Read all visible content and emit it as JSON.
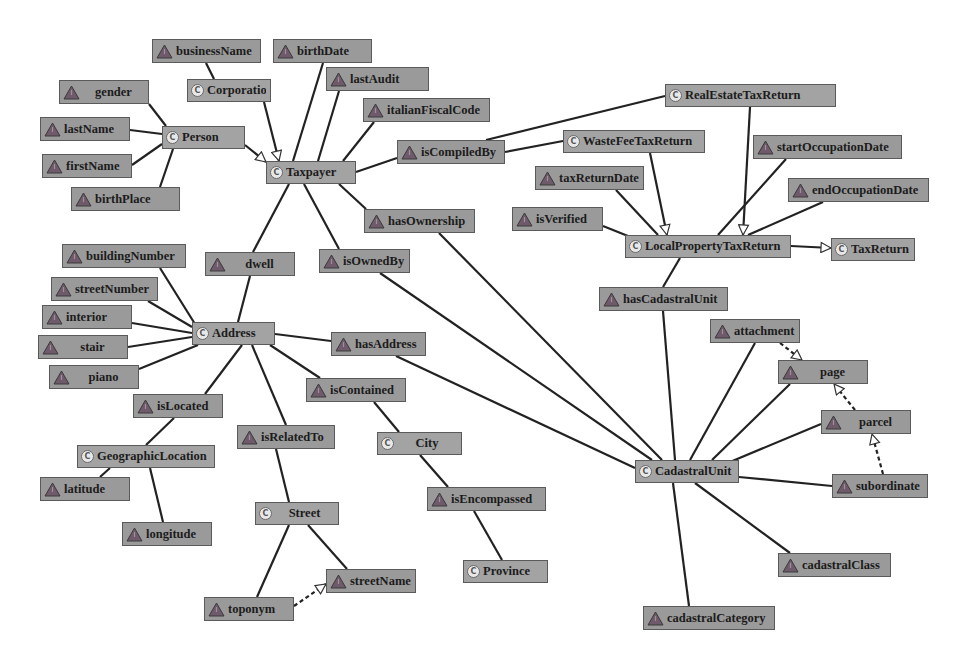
{
  "diagram": {
    "colors": {
      "node_fill": "#9a9a9a",
      "node_border": "#5a5a5a",
      "edge": "#222222",
      "property_icon": "#6e5a6a",
      "class_icon": "#e8e8e8",
      "background": "#ffffff"
    },
    "legend_hint": {
      "class_icon_glyph": "C",
      "property_icon_glyph": "triangle"
    },
    "nodes": [
      {
        "id": "businessName",
        "label": "businessName",
        "kind": "property",
        "x": 152,
        "y": 39,
        "w": 109,
        "h": 24
      },
      {
        "id": "birthDate",
        "label": "birthDate",
        "kind": "property",
        "x": 273,
        "y": 39,
        "w": 99,
        "h": 24
      },
      {
        "id": "Corporation",
        "label": "Corporation",
        "kind": "class",
        "x": 187,
        "y": 79,
        "w": 84,
        "h": 23
      },
      {
        "id": "lastAudit",
        "label": "lastAudit",
        "kind": "property",
        "x": 326,
        "y": 67,
        "w": 103,
        "h": 24
      },
      {
        "id": "gender",
        "label": "gender",
        "kind": "property",
        "x": 59,
        "y": 80,
        "w": 90,
        "h": 24
      },
      {
        "id": "italianFiscalCode",
        "label": "italianFiscalCode",
        "kind": "property",
        "x": 363,
        "y": 98,
        "w": 127,
        "h": 24
      },
      {
        "id": "Person",
        "label": "Person",
        "kind": "class",
        "x": 162,
        "y": 126,
        "w": 83,
        "h": 23
      },
      {
        "id": "lastName",
        "label": "lastName",
        "kind": "property",
        "x": 40,
        "y": 117,
        "w": 90,
        "h": 24
      },
      {
        "id": "firstName",
        "label": "firstName",
        "kind": "property",
        "x": 42,
        "y": 154,
        "w": 90,
        "h": 24
      },
      {
        "id": "birthPlace",
        "label": "birthPlace",
        "kind": "property",
        "x": 71,
        "y": 187,
        "w": 109,
        "h": 24
      },
      {
        "id": "Taxpayer",
        "label": "Taxpayer",
        "kind": "class",
        "x": 266,
        "y": 161,
        "w": 90,
        "h": 23
      },
      {
        "id": "isCompiledBy",
        "label": "isCompiledBy",
        "kind": "property",
        "x": 397,
        "y": 140,
        "w": 108,
        "h": 24
      },
      {
        "id": "RealEstateTaxReturn",
        "label": "RealEstateTaxReturn",
        "kind": "class",
        "x": 665,
        "y": 84,
        "w": 171,
        "h": 23
      },
      {
        "id": "WasteFeeTaxReturn",
        "label": "WasteFeeTaxReturn",
        "kind": "class",
        "x": 563,
        "y": 130,
        "w": 142,
        "h": 23
      },
      {
        "id": "taxReturnDate",
        "label": "taxReturnDate",
        "kind": "property",
        "x": 535,
        "y": 166,
        "w": 109,
        "h": 24
      },
      {
        "id": "startOccupationDate",
        "label": "startOccupationDate",
        "kind": "property",
        "x": 753,
        "y": 135,
        "w": 149,
        "h": 24
      },
      {
        "id": "endOccupationDate",
        "label": "endOccupationDate",
        "kind": "property",
        "x": 788,
        "y": 178,
        "w": 141,
        "h": 24
      },
      {
        "id": "isVerified",
        "label": "isVerified",
        "kind": "property",
        "x": 512,
        "y": 207,
        "w": 91,
        "h": 24
      },
      {
        "id": "hasOwnership",
        "label": "hasOwnership",
        "kind": "property",
        "x": 364,
        "y": 209,
        "w": 111,
        "h": 24
      },
      {
        "id": "LocalPropertyTaxReturn",
        "label": "LocalPropertyTaxReturn",
        "kind": "class",
        "x": 625,
        "y": 235,
        "w": 166,
        "h": 23
      },
      {
        "id": "TaxReturn",
        "label": "TaxReturn",
        "kind": "class",
        "x": 831,
        "y": 238,
        "w": 84,
        "h": 23
      },
      {
        "id": "dwell",
        "label": "dwell",
        "kind": "property",
        "x": 205,
        "y": 252,
        "w": 90,
        "h": 24
      },
      {
        "id": "isOwnedBy",
        "label": "isOwnedBy",
        "kind": "property",
        "x": 319,
        "y": 249,
        "w": 91,
        "h": 24
      },
      {
        "id": "buildingNumber",
        "label": "buildingNumber",
        "kind": "property",
        "x": 62,
        "y": 244,
        "w": 124,
        "h": 24
      },
      {
        "id": "streetNumber",
        "label": "streetNumber",
        "kind": "property",
        "x": 51,
        "y": 277,
        "w": 107,
        "h": 24
      },
      {
        "id": "interior",
        "label": "interior",
        "kind": "property",
        "x": 42,
        "y": 305,
        "w": 90,
        "h": 24
      },
      {
        "id": "stair",
        "label": "stair",
        "kind": "property",
        "x": 38,
        "y": 335,
        "w": 90,
        "h": 24
      },
      {
        "id": "piano",
        "label": "piano",
        "kind": "property",
        "x": 49,
        "y": 365,
        "w": 90,
        "h": 24
      },
      {
        "id": "Address",
        "label": "Address",
        "kind": "class",
        "x": 192,
        "y": 322,
        "w": 83,
        "h": 23
      },
      {
        "id": "hasCadastralUnit",
        "label": "hasCadastralUnit",
        "kind": "property",
        "x": 599,
        "y": 287,
        "w": 129,
        "h": 24
      },
      {
        "id": "hasAddress",
        "label": "hasAddress",
        "kind": "property",
        "x": 331,
        "y": 332,
        "w": 95,
        "h": 24
      },
      {
        "id": "attachment",
        "label": "attachment",
        "kind": "property",
        "x": 710,
        "y": 319,
        "w": 90,
        "h": 24
      },
      {
        "id": "page",
        "label": "page",
        "kind": "property",
        "x": 778,
        "y": 360,
        "w": 90,
        "h": 24
      },
      {
        "id": "isLocated",
        "label": "isLocated",
        "kind": "property",
        "x": 133,
        "y": 394,
        "w": 90,
        "h": 24
      },
      {
        "id": "isContained",
        "label": "isContained",
        "kind": "property",
        "x": 306,
        "y": 378,
        "w": 100,
        "h": 24
      },
      {
        "id": "parcel",
        "label": "parcel",
        "kind": "property",
        "x": 821,
        "y": 410,
        "w": 90,
        "h": 24
      },
      {
        "id": "GeographicLocation",
        "label": "GeographicLocation",
        "kind": "class",
        "x": 77,
        "y": 445,
        "w": 138,
        "h": 23
      },
      {
        "id": "isRelatedTo",
        "label": "isRelatedTo",
        "kind": "property",
        "x": 237,
        "y": 425,
        "w": 98,
        "h": 24
      },
      {
        "id": "City",
        "label": "City",
        "kind": "class",
        "x": 377,
        "y": 432,
        "w": 85,
        "h": 23
      },
      {
        "id": "CadastralUnit",
        "label": "CadastralUnit",
        "kind": "class",
        "x": 635,
        "y": 460,
        "w": 104,
        "h": 23
      },
      {
        "id": "subordinate",
        "label": "subordinate",
        "kind": "property",
        "x": 832,
        "y": 474,
        "w": 96,
        "h": 24
      },
      {
        "id": "latitude",
        "label": "latitude",
        "kind": "property",
        "x": 40,
        "y": 477,
        "w": 90,
        "h": 24
      },
      {
        "id": "isEncompassed",
        "label": "isEncompassed",
        "kind": "property",
        "x": 427,
        "y": 487,
        "w": 119,
        "h": 24
      },
      {
        "id": "Street",
        "label": "Street",
        "kind": "class",
        "x": 255,
        "y": 502,
        "w": 84,
        "h": 23
      },
      {
        "id": "longitude",
        "label": "longitude",
        "kind": "property",
        "x": 122,
        "y": 522,
        "w": 90,
        "h": 24
      },
      {
        "id": "streetName",
        "label": "streetName",
        "kind": "property",
        "x": 326,
        "y": 569,
        "w": 90,
        "h": 24
      },
      {
        "id": "toponym",
        "label": "toponym",
        "kind": "property",
        "x": 204,
        "y": 597,
        "w": 90,
        "h": 24
      },
      {
        "id": "Province",
        "label": "Province",
        "kind": "class",
        "x": 463,
        "y": 560,
        "w": 85,
        "h": 23
      },
      {
        "id": "cadastralClass",
        "label": "cadastralClass",
        "kind": "property",
        "x": 778,
        "y": 553,
        "w": 113,
        "h": 24
      },
      {
        "id": "cadastralCategory",
        "label": "cadastralCategory",
        "kind": "property",
        "x": 643,
        "y": 606,
        "w": 132,
        "h": 24
      }
    ],
    "edges": [
      {
        "from": [
          206,
          63
        ],
        "to": [
          214,
          79
        ],
        "type": "line"
      },
      {
        "from": [
          323,
          63
        ],
        "to": [
          293,
          161
        ],
        "type": "line"
      },
      {
        "from": [
          264,
          102
        ],
        "to": [
          279,
          161
        ],
        "type": "subclass"
      },
      {
        "from": [
          339,
          91
        ],
        "to": [
          318,
          161
        ],
        "type": "line"
      },
      {
        "from": [
          374,
          122
        ],
        "to": [
          343,
          161
        ],
        "type": "line"
      },
      {
        "from": [
          149,
          104
        ],
        "to": [
          166,
          126
        ],
        "type": "line"
      },
      {
        "from": [
          130,
          130
        ],
        "to": [
          162,
          134
        ],
        "type": "line"
      },
      {
        "from": [
          132,
          165
        ],
        "to": [
          162,
          144
        ],
        "type": "line"
      },
      {
        "from": [
          160,
          187
        ],
        "to": [
          173,
          149
        ],
        "type": "line"
      },
      {
        "from": [
          245,
          145
        ],
        "to": [
          266,
          162
        ],
        "type": "subclass"
      },
      {
        "from": [
          356,
          172
        ],
        "to": [
          397,
          158
        ],
        "type": "line"
      },
      {
        "from": [
          486,
          140
        ],
        "to": [
          665,
          96
        ],
        "type": "line"
      },
      {
        "from": [
          505,
          152
        ],
        "to": [
          563,
          141
        ],
        "type": "line"
      },
      {
        "from": [
          750,
          107
        ],
        "to": [
          743,
          235
        ],
        "type": "subclass"
      },
      {
        "from": [
          650,
          153
        ],
        "to": [
          667,
          235
        ],
        "type": "subclass"
      },
      {
        "from": [
          616,
          190
        ],
        "to": [
          658,
          235
        ],
        "type": "line"
      },
      {
        "from": [
          786,
          159
        ],
        "to": [
          718,
          235
        ],
        "type": "line"
      },
      {
        "from": [
          823,
          202
        ],
        "to": [
          748,
          235
        ],
        "type": "line"
      },
      {
        "from": [
          603,
          226
        ],
        "to": [
          628,
          236
        ],
        "type": "line"
      },
      {
        "from": [
          791,
          246
        ],
        "to": [
          831,
          248
        ],
        "type": "subclass"
      },
      {
        "from": [
          680,
          258
        ],
        "to": [
          663,
          287
        ],
        "type": "line"
      },
      {
        "from": [
          663,
          311
        ],
        "to": [
          675,
          460
        ],
        "type": "line"
      },
      {
        "from": [
          339,
          184
        ],
        "to": [
          366,
          209
        ],
        "type": "line"
      },
      {
        "from": [
          439,
          233
        ],
        "to": [
          662,
          460
        ],
        "type": "line"
      },
      {
        "from": [
          304,
          184
        ],
        "to": [
          339,
          249
        ],
        "type": "line"
      },
      {
        "from": [
          380,
          273
        ],
        "to": [
          652,
          460
        ],
        "type": "line"
      },
      {
        "from": [
          289,
          184
        ],
        "to": [
          253,
          252
        ],
        "type": "line"
      },
      {
        "from": [
          250,
          276
        ],
        "to": [
          238,
          322
        ],
        "type": "line"
      },
      {
        "from": [
          160,
          268
        ],
        "to": [
          195,
          324
        ],
        "type": "line"
      },
      {
        "from": [
          148,
          301
        ],
        "to": [
          192,
          327
        ],
        "type": "line"
      },
      {
        "from": [
          132,
          323
        ],
        "to": [
          192,
          333
        ],
        "type": "line"
      },
      {
        "from": [
          128,
          347
        ],
        "to": [
          192,
          337
        ],
        "type": "line"
      },
      {
        "from": [
          139,
          369
        ],
        "to": [
          198,
          345
        ],
        "type": "line"
      },
      {
        "from": [
          275,
          334
        ],
        "to": [
          331,
          341
        ],
        "type": "line"
      },
      {
        "from": [
          396,
          356
        ],
        "to": [
          635,
          468
        ],
        "type": "line"
      },
      {
        "from": [
          270,
          345
        ],
        "to": [
          320,
          378
        ],
        "type": "line"
      },
      {
        "from": [
          242,
          345
        ],
        "to": [
          205,
          394
        ],
        "type": "line"
      },
      {
        "from": [
          252,
          345
        ],
        "to": [
          286,
          425
        ],
        "type": "line"
      },
      {
        "from": [
          174,
          418
        ],
        "to": [
          146,
          445
        ],
        "type": "line"
      },
      {
        "from": [
          110,
          468
        ],
        "to": [
          100,
          477
        ],
        "type": "line"
      },
      {
        "from": [
          150,
          468
        ],
        "to": [
          163,
          522
        ],
        "type": "line"
      },
      {
        "from": [
          374,
          402
        ],
        "to": [
          399,
          432
        ],
        "type": "line"
      },
      {
        "from": [
          420,
          455
        ],
        "to": [
          448,
          487
        ],
        "type": "line"
      },
      {
        "from": [
          474,
          511
        ],
        "to": [
          502,
          560
        ],
        "type": "line"
      },
      {
        "from": [
          276,
          449
        ],
        "to": [
          289,
          502
        ],
        "type": "line"
      },
      {
        "from": [
          308,
          525
        ],
        "to": [
          347,
          569
        ],
        "type": "line"
      },
      {
        "from": [
          289,
          525
        ],
        "to": [
          257,
          597
        ],
        "type": "line"
      },
      {
        "from": [
          294,
          606
        ],
        "to": [
          326,
          584
        ],
        "type": "dashed-subclass"
      },
      {
        "from": [
          755,
          343
        ],
        "to": [
          690,
          460
        ],
        "type": "line"
      },
      {
        "from": [
          790,
          384
        ],
        "to": [
          712,
          460
        ],
        "type": "line"
      },
      {
        "from": [
          821,
          424
        ],
        "to": [
          730,
          462
        ],
        "type": "line"
      },
      {
        "from": [
          739,
          477
        ],
        "to": [
          832,
          486
        ],
        "type": "line"
      },
      {
        "from": [
          695,
          483
        ],
        "to": [
          790,
          553
        ],
        "type": "line"
      },
      {
        "from": [
          673,
          483
        ],
        "to": [
          689,
          606
        ],
        "type": "line"
      },
      {
        "from": [
          780,
          343
        ],
        "to": [
          802,
          360
        ],
        "type": "dashed-subclass"
      },
      {
        "from": [
          855,
          410
        ],
        "to": [
          834,
          384
        ],
        "type": "dashed-subclass"
      },
      {
        "from": [
          883,
          474
        ],
        "to": [
          872,
          434
        ],
        "type": "dashed-subclass"
      }
    ]
  }
}
